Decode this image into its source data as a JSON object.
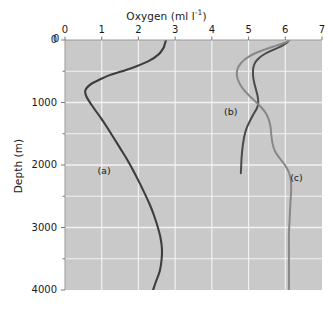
{
  "chart_data": {
    "type": "line",
    "xlabel": "Oxygen (ml l⁻¹)",
    "ylabel": "Depth (m)",
    "xlim": [
      0,
      7
    ],
    "ylim": [
      0,
      4000
    ],
    "y_inverted": true,
    "x_axis_position": "top",
    "grid": true,
    "grid_major_x": [
      0,
      1,
      2,
      3,
      4,
      5,
      6,
      7
    ],
    "grid_minor_y_step": 500,
    "legend": "none",
    "plot_background": "#c9c9c9",
    "grid_color": "#f2f2f2",
    "xticks": [
      "0",
      "1",
      "2",
      "3",
      "4",
      "5",
      "6",
      "7"
    ],
    "yticks": [
      "0",
      "1000",
      "2000",
      "3000",
      "4000"
    ],
    "annotations": [
      {
        "text": "(a)",
        "x": 1.1,
        "y": 2100
      },
      {
        "text": "(b)",
        "x": 4.55,
        "y": 1150
      },
      {
        "text": "(c)",
        "x": 6.35,
        "y": 2200
      }
    ],
    "series": [
      {
        "name": "(a)",
        "label": "(a)",
        "color": "#3d3d3d",
        "width": 2.1,
        "points": [
          [
            2.75,
            0
          ],
          [
            2.72,
            60
          ],
          [
            2.68,
            130
          ],
          [
            2.55,
            230
          ],
          [
            2.3,
            330
          ],
          [
            1.95,
            420
          ],
          [
            1.55,
            500
          ],
          [
            1.18,
            570
          ],
          [
            0.92,
            640
          ],
          [
            0.72,
            700
          ],
          [
            0.6,
            760
          ],
          [
            0.55,
            820
          ],
          [
            0.58,
            900
          ],
          [
            0.68,
            1000
          ],
          [
            0.82,
            1120
          ],
          [
            0.98,
            1250
          ],
          [
            1.15,
            1400
          ],
          [
            1.32,
            1560
          ],
          [
            1.5,
            1730
          ],
          [
            1.68,
            1900
          ],
          [
            1.85,
            2080
          ],
          [
            2.0,
            2250
          ],
          [
            2.15,
            2430
          ],
          [
            2.3,
            2620
          ],
          [
            2.42,
            2800
          ],
          [
            2.52,
            2980
          ],
          [
            2.6,
            3160
          ],
          [
            2.64,
            3340
          ],
          [
            2.63,
            3520
          ],
          [
            2.58,
            3700
          ],
          [
            2.48,
            3860
          ],
          [
            2.4,
            4000
          ]
        ]
      },
      {
        "name": "(b)",
        "label": "(b)",
        "color": "#4a4a4a",
        "width": 2.0,
        "points": [
          [
            6.1,
            0
          ],
          [
            6.05,
            40
          ],
          [
            5.92,
            90
          ],
          [
            5.7,
            150
          ],
          [
            5.45,
            220
          ],
          [
            5.28,
            290
          ],
          [
            5.18,
            360
          ],
          [
            5.13,
            440
          ],
          [
            5.12,
            520
          ],
          [
            5.13,
            610
          ],
          [
            5.16,
            700
          ],
          [
            5.2,
            790
          ],
          [
            5.24,
            880
          ],
          [
            5.26,
            960
          ],
          [
            5.26,
            1030
          ],
          [
            5.22,
            1100
          ],
          [
            5.14,
            1180
          ],
          [
            5.05,
            1280
          ],
          [
            4.96,
            1390
          ],
          [
            4.9,
            1500
          ],
          [
            4.86,
            1620
          ],
          [
            4.83,
            1750
          ],
          [
            4.81,
            1880
          ],
          [
            4.8,
            2000
          ],
          [
            4.79,
            2130
          ]
        ]
      },
      {
        "name": "(c)",
        "label": "(c)",
        "color": "#888888",
        "width": 2.0,
        "points": [
          [
            6.12,
            0
          ],
          [
            6.0,
            40
          ],
          [
            5.75,
            90
          ],
          [
            5.45,
            150
          ],
          [
            5.15,
            220
          ],
          [
            4.92,
            300
          ],
          [
            4.78,
            380
          ],
          [
            4.7,
            460
          ],
          [
            4.68,
            540
          ],
          [
            4.7,
            620
          ],
          [
            4.76,
            700
          ],
          [
            4.86,
            790
          ],
          [
            5.0,
            880
          ],
          [
            5.18,
            980
          ],
          [
            5.35,
            1080
          ],
          [
            5.48,
            1180
          ],
          [
            5.56,
            1290
          ],
          [
            5.6,
            1400
          ],
          [
            5.62,
            1520
          ],
          [
            5.65,
            1650
          ],
          [
            5.72,
            1780
          ],
          [
            5.86,
            1900
          ],
          [
            6.0,
            2010
          ],
          [
            6.1,
            2120
          ],
          [
            6.15,
            2240
          ],
          [
            6.16,
            2400
          ],
          [
            6.14,
            2600
          ],
          [
            6.12,
            2850
          ],
          [
            6.1,
            3100
          ],
          [
            6.1,
            3400
          ],
          [
            6.1,
            3700
          ],
          [
            6.1,
            4000
          ]
        ]
      }
    ]
  },
  "figure": {
    "x_title_main": "Oxygen (ml l",
    "x_title_sup": "-1",
    "x_title_tail": ")",
    "y_title": "Depth (m)",
    "corner_zero": "0"
  }
}
